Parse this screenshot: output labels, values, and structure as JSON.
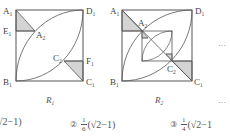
{
  "figures": [
    {
      "id": "R1",
      "caption": "R",
      "caption_sub": "1",
      "labels": {
        "A1": {
          "main": "A",
          "sub": "1"
        },
        "D1": {
          "main": "D",
          "sub": "1"
        },
        "E1": {
          "main": "E",
          "sub": "1"
        },
        "A2": {
          "main": "A",
          "sub": "2"
        },
        "C2": {
          "main": "C",
          "sub": "2"
        },
        "F1": {
          "main": "F",
          "sub": "1"
        },
        "B1": {
          "main": "B",
          "sub": "1"
        },
        "C1": {
          "main": "C",
          "sub": "1"
        }
      }
    },
    {
      "id": "R2",
      "caption": "R",
      "caption_sub": "2",
      "labels": {
        "A1": {
          "main": "A",
          "sub": "1"
        },
        "D1": {
          "main": "D",
          "sub": "1"
        },
        "A2": {
          "main": "A",
          "sub": "2"
        },
        "C2": {
          "main": "C",
          "sub": "2"
        },
        "B1": {
          "main": "B",
          "sub": "1"
        },
        "C1": {
          "main": "C",
          "sub": "1"
        }
      }
    }
  ],
  "ellipsis": "…",
  "options": [
    {
      "marker": "",
      "prefix": "",
      "frac_num": "",
      "frac_den": "",
      "expr": "√2−1)"
    },
    {
      "marker": "②",
      "frac_num": "1",
      "frac_den": "6",
      "expr": "(√2−1)"
    },
    {
      "marker": "③",
      "frac_num": "1",
      "frac_den": "4",
      "expr": "(√2−1"
    }
  ],
  "colors": {
    "line": "#555555",
    "shade": "#d4d4d4"
  }
}
